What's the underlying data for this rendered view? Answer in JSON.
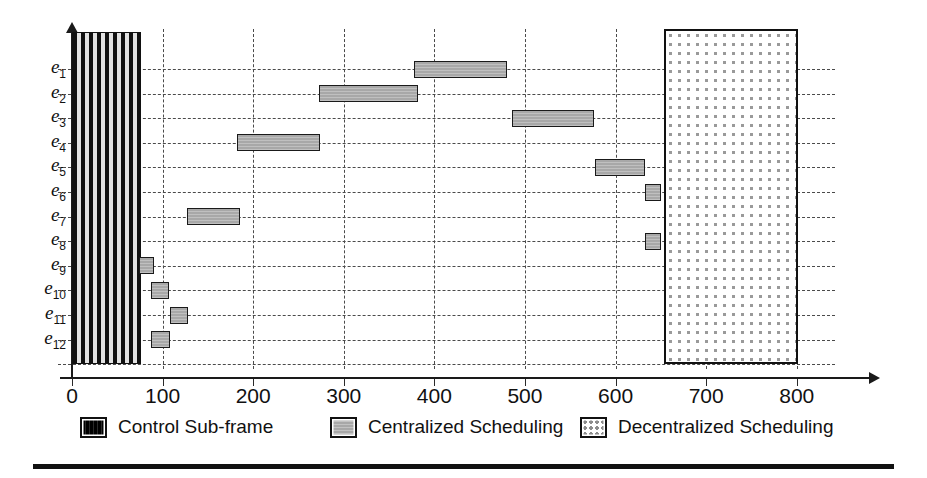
{
  "chart_data": {
    "type": "bar",
    "orientation": "horizontal",
    "title": "",
    "subtitle": "",
    "xlabel": "",
    "ylabel": "",
    "xlim": [
      0,
      840
    ],
    "ylim_categories": [
      "e1",
      "e2",
      "e3",
      "e4",
      "e5",
      "e6",
      "e7",
      "e8",
      "e9",
      "e10",
      "e11",
      "e12"
    ],
    "x_ticks": [
      0,
      100,
      200,
      300,
      400,
      500,
      600,
      700,
      800
    ],
    "x_tick_labels": [
      "0",
      "100",
      "200",
      "300",
      "400",
      "500",
      "600",
      "700",
      "800"
    ],
    "grid": true,
    "grid_style": "dashed",
    "legend_position": "bottom",
    "y_categories": [
      {
        "id": "e1",
        "label_base": "e",
        "label_sub": "1"
      },
      {
        "id": "e2",
        "label_base": "e",
        "label_sub": "2"
      },
      {
        "id": "e3",
        "label_base": "e",
        "label_sub": "3"
      },
      {
        "id": "e4",
        "label_base": "e",
        "label_sub": "4"
      },
      {
        "id": "e5",
        "label_base": "e",
        "label_sub": "5"
      },
      {
        "id": "e6",
        "label_base": "e",
        "label_sub": "6"
      },
      {
        "id": "e7",
        "label_base": "e",
        "label_sub": "7"
      },
      {
        "id": "e8",
        "label_base": "e",
        "label_sub": "8"
      },
      {
        "id": "e9",
        "label_base": "e",
        "label_sub": "9"
      },
      {
        "id": "e10",
        "label_base": "e",
        "label_sub": "10"
      },
      {
        "id": "e11",
        "label_base": "e",
        "label_sub": "11"
      },
      {
        "id": "e12",
        "label_base": "e",
        "label_sub": "12"
      }
    ],
    "series": [
      {
        "name": "Centralized Scheduling",
        "type": "gantt-bars",
        "color": "#a8a8a8",
        "bars": [
          {
            "category": "e1",
            "start": 377,
            "end": 480
          },
          {
            "category": "e2",
            "start": 273,
            "end": 382
          },
          {
            "category": "e3",
            "start": 486,
            "end": 576
          },
          {
            "category": "e4",
            "start": 182,
            "end": 274
          },
          {
            "category": "e5",
            "start": 577,
            "end": 632
          },
          {
            "category": "e6",
            "start": 632,
            "end": 650
          },
          {
            "category": "e7",
            "start": 127,
            "end": 185
          },
          {
            "category": "e8",
            "start": 632,
            "end": 650
          },
          {
            "category": "e9",
            "start": 74,
            "end": 91
          },
          {
            "category": "e10",
            "start": 87,
            "end": 107
          },
          {
            "category": "e11",
            "start": 108,
            "end": 128
          },
          {
            "category": "e12",
            "start": 87,
            "end": 108
          }
        ]
      },
      {
        "name": "Control Sub-frame",
        "type": "region",
        "color": "#111111",
        "start": 0,
        "end": 76
      },
      {
        "name": "Decentralized Scheduling",
        "type": "region",
        "color": "#9a9a9a",
        "start": 653,
        "end": 801
      }
    ]
  },
  "legend": {
    "entries": [
      {
        "name": "legend-control-sub-frame",
        "label": "Control Sub-frame"
      },
      {
        "name": "legend-centralized-scheduling",
        "label": "Centralized Scheduling"
      },
      {
        "name": "legend-decentralized-scheduling",
        "label": "Decentralized Scheduling"
      }
    ]
  },
  "colors": {
    "axis": "#1a1a1a",
    "grid": "#4a4a4a",
    "bar_fill": "#a8a8a8",
    "bar_border": "#1a1a1a",
    "control_block": "#111111",
    "decentral_dots": "#9a9a9a",
    "background": "#ffffff",
    "text": "#111111"
  }
}
